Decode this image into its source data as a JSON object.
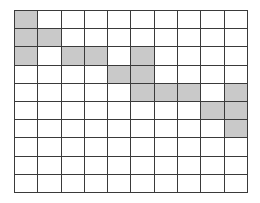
{
  "grid": {
    "rows": 10,
    "cols": 10,
    "fill_color": "#c9c9c9",
    "empty_color": "#ffffff",
    "line_color": "#3a3a3a",
    "filled_cells": [
      [
        0,
        0
      ],
      [
        1,
        0
      ],
      [
        1,
        1
      ],
      [
        2,
        0
      ],
      [
        2,
        2
      ],
      [
        2,
        3
      ],
      [
        2,
        5
      ],
      [
        3,
        4
      ],
      [
        3,
        5
      ],
      [
        4,
        5
      ],
      [
        4,
        6
      ],
      [
        4,
        7
      ],
      [
        4,
        9
      ],
      [
        5,
        8
      ],
      [
        5,
        9
      ],
      [
        6,
        9
      ]
    ]
  }
}
